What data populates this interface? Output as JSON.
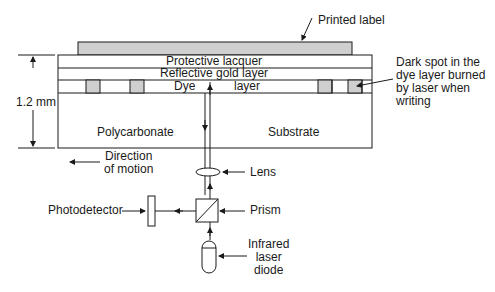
{
  "layers": {
    "label": "Printed label",
    "protective": "Protective lacquer",
    "reflective": "Reflective gold layer",
    "dye_left": "Dye",
    "dye_right": "layer",
    "substrate_left": "Polycarbonate",
    "substrate_right": "Substrate"
  },
  "dimension": "1.2 mm",
  "annotations": {
    "dark_spot": [
      "Dark spot in the",
      "dye layer burned",
      "by laser when",
      "writing"
    ],
    "direction": [
      "Direction",
      "of motion"
    ]
  },
  "optics": {
    "lens": "Lens",
    "prism": "Prism",
    "photodetector": "Photodetector",
    "laser": [
      "Infrared",
      "laser",
      "diode"
    ]
  },
  "colors": {
    "fill_gray": "#cfcfcf",
    "stroke": "#1a1a1a",
    "background": "#ffffff"
  }
}
